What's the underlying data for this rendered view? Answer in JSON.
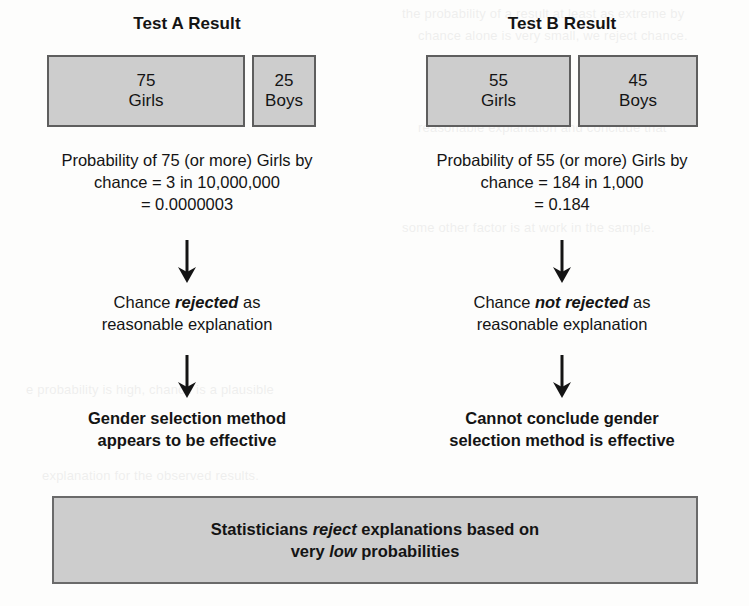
{
  "columns": [
    {
      "title": "Test A Result",
      "boxes": {
        "girls": {
          "count": "75",
          "label": "Girls"
        },
        "boys": {
          "count": "25",
          "label": "Boys"
        }
      },
      "probability": {
        "line1": "Probability of 75 (or more) Girls by",
        "line2": "chance = 3 in 10,000,000",
        "line3": "= 0.0000003"
      },
      "chance": {
        "prefix": "Chance ",
        "emphasis": "rejected",
        "suffix": " as",
        "line2": "reasonable explanation"
      },
      "conclusion": {
        "line1": "Gender selection method",
        "line2": "appears to be effective"
      }
    },
    {
      "title": "Test B Result",
      "boxes": {
        "girls": {
          "count": "55",
          "label": "Girls"
        },
        "boys": {
          "count": "45",
          "label": "Boys"
        }
      },
      "probability": {
        "line1": "Probability of 55 (or more) Girls by",
        "line2": "chance = 184 in 1,000",
        "line3": "= 0.184"
      },
      "chance": {
        "prefix": "Chance ",
        "emphasis": "not rejected",
        "suffix": " as",
        "line2": "reasonable explanation"
      },
      "conclusion": {
        "line1": "Cannot conclude gender",
        "line2": "selection method is effective"
      }
    }
  ],
  "summary": {
    "line1_prefix": "Statisticians ",
    "line1_emphasis": "reject",
    "line1_suffix": " explanations based on",
    "line2_prefix": "very ",
    "line2_emphasis": "low",
    "line2_suffix": " probabilities"
  },
  "colors": {
    "box_fill": "#cdcdcd",
    "box_border": "#5e5e5e",
    "text": "#141414",
    "page_background": "#fdfdfc"
  }
}
